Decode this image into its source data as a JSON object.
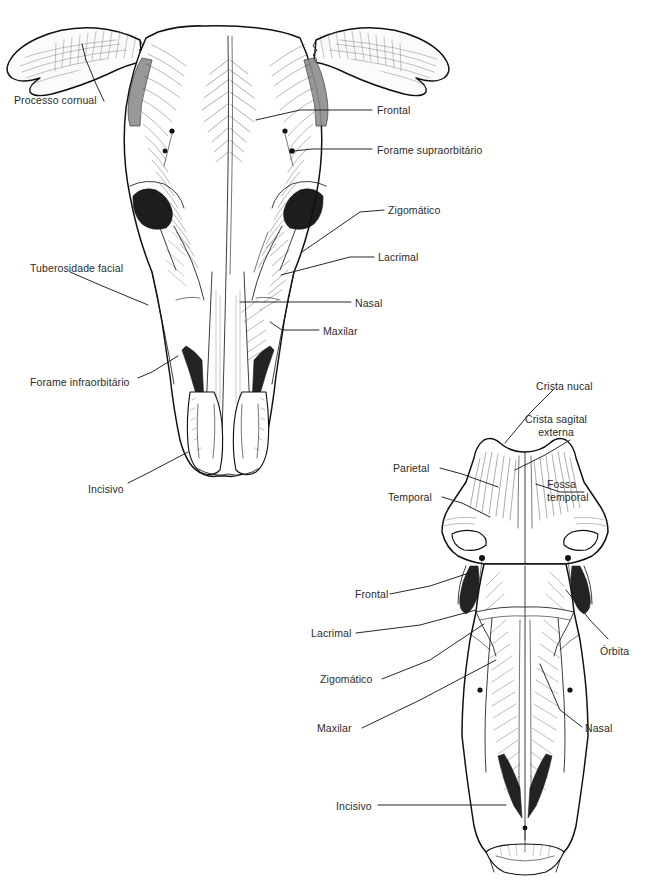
{
  "plate": {
    "width": 647,
    "height": 896,
    "background": "#ffffff",
    "ink": "#111111",
    "text_color": "#2b2b2b",
    "cut_off_top_line": ""
  },
  "figures": [
    {
      "id": "skull-frontal",
      "name": "cranio-bovino-vista-frontal",
      "view": "frontal",
      "labels": [
        {
          "id": "processo-cornual",
          "text": "Processo cornual",
          "x": 14,
          "y": 94,
          "align": "left",
          "leader": [
            [
              104,
              101
            ],
            [
              96,
              84
            ],
            [
              86,
              60
            ],
            [
              82,
              44
            ]
          ]
        },
        {
          "id": "frontal",
          "text": "Frontal",
          "x": 377,
          "y": 104,
          "align": "left",
          "leader": [
            [
              372,
              110
            ],
            [
              300,
              110
            ],
            [
              256,
              120
            ]
          ]
        },
        {
          "id": "forame-supraorbitario",
          "text": "Forame supraorbitário",
          "x": 377,
          "y": 144,
          "align": "left",
          "leader": [
            [
              372,
              149
            ],
            [
              312,
              149
            ],
            [
              294,
              151
            ]
          ]
        },
        {
          "id": "zigomatico",
          "text": "Zigomático",
          "x": 388,
          "y": 204,
          "align": "left",
          "leader": [
            [
              384,
              210
            ],
            [
              360,
              212
            ],
            [
              302,
              252
            ]
          ]
        },
        {
          "id": "lacrimal",
          "text": "Lacrimal",
          "x": 378,
          "y": 251,
          "align": "left",
          "leader": [
            [
              374,
              257
            ],
            [
              350,
              257
            ],
            [
              281,
              275
            ]
          ]
        },
        {
          "id": "nasal",
          "text": "Nasal",
          "x": 355,
          "y": 297,
          "align": "left",
          "leader": [
            [
              351,
              302
            ],
            [
              240,
              302
            ]
          ]
        },
        {
          "id": "maxilar",
          "text": "Maxilar",
          "x": 323,
          "y": 325,
          "align": "left",
          "leader": [
            [
              319,
              330
            ],
            [
              282,
              330
            ],
            [
              270,
              322
            ]
          ]
        },
        {
          "id": "tuberosidade-facial",
          "text": "Tuberosidade facial",
          "x": 30,
          "y": 262,
          "align": "left",
          "leader": [
            [
              70,
              272
            ],
            [
              100,
              285
            ],
            [
              148,
              305
            ]
          ]
        },
        {
          "id": "forame-infraorbitario",
          "text": "Forame infraorbitário",
          "x": 30,
          "y": 376,
          "align": "left",
          "leader": [
            [
              138,
              378
            ],
            [
              152,
              372
            ],
            [
              178,
              356
            ]
          ]
        },
        {
          "id": "incisivo",
          "text": "Incisivo",
          "x": 88,
          "y": 483,
          "align": "left",
          "leader": [
            [
              128,
              483
            ],
            [
              150,
              472
            ],
            [
              188,
              452
            ]
          ]
        }
      ]
    },
    {
      "id": "skull-dorsal",
      "name": "cranio-bovino-vista-dorsal",
      "view": "dorsal",
      "labels": [
        {
          "id": "crista-nucal",
          "text": "Crista nucal",
          "x": 536,
          "y": 380,
          "align": "left",
          "leader": [
            [
              553,
              390
            ],
            [
              530,
              413
            ],
            [
              505,
              443
            ]
          ]
        },
        {
          "id": "crista-sagital-externa",
          "text": "Crista sagital externa",
          "lines": [
            "Crista sagital",
            "externa"
          ],
          "x": 556,
          "y": 413,
          "align": "center",
          "leader": [
            [
              570,
              440
            ],
            [
              545,
              455
            ],
            [
              515,
              470
            ]
          ]
        },
        {
          "id": "parietal",
          "text": "Parietal",
          "x": 393,
          "y": 462,
          "align": "left",
          "leader": [
            [
              440,
              468
            ],
            [
              462,
              474
            ],
            [
              498,
              487
            ]
          ]
        },
        {
          "id": "temporal",
          "text": "Temporal",
          "x": 388,
          "y": 491,
          "align": "left",
          "leader": [
            [
              442,
              497
            ],
            [
              462,
              503
            ],
            [
              490,
              517
            ]
          ]
        },
        {
          "id": "fossa-temporal",
          "text": "Fossa temporal",
          "lines": [
            "Fossa",
            "temporal"
          ],
          "x": 587,
          "y": 478,
          "align": "left",
          "leader": [
            [
              584,
              492
            ],
            [
              560,
              492
            ],
            [
              536,
              484
            ]
          ]
        },
        {
          "id": "frontal-2",
          "text": "Frontal",
          "x": 355,
          "y": 588,
          "align": "left",
          "leader": [
            [
              390,
              594
            ],
            [
              430,
              586
            ],
            [
              478,
              570
            ]
          ]
        },
        {
          "id": "lacrimal-2",
          "text": "Lacrimal",
          "x": 311,
          "y": 627,
          "align": "left",
          "leader": [
            [
              356,
              633
            ],
            [
              420,
              625
            ],
            [
              476,
              610
            ]
          ]
        },
        {
          "id": "zigomatico-2",
          "text": "Zigomático",
          "x": 320,
          "y": 673,
          "align": "left",
          "leader": [
            [
              382,
              679
            ],
            [
              430,
              660
            ],
            [
              484,
              624
            ]
          ]
        },
        {
          "id": "maxilar-2",
          "text": "Maxilar",
          "x": 317,
          "y": 722,
          "align": "left",
          "leader": [
            [
              362,
              728
            ],
            [
              420,
              700
            ],
            [
              496,
              660
            ]
          ]
        },
        {
          "id": "orbita",
          "text": "Órbita",
          "x": 600,
          "y": 645,
          "align": "left",
          "leader": [
            [
              608,
              639
            ],
            [
              590,
              620
            ],
            [
              566,
              590
            ]
          ]
        },
        {
          "id": "nasal-2",
          "text": "Nasal",
          "x": 585,
          "y": 722,
          "align": "left",
          "leader": [
            [
              582,
              727
            ],
            [
              560,
              710
            ],
            [
              540,
              664
            ]
          ]
        },
        {
          "id": "incisivo-2",
          "text": "Incisivo",
          "x": 336,
          "y": 800,
          "align": "left",
          "leader": [
            [
              378,
              805
            ],
            [
              450,
              805
            ],
            [
              506,
              805
            ]
          ]
        }
      ]
    }
  ]
}
